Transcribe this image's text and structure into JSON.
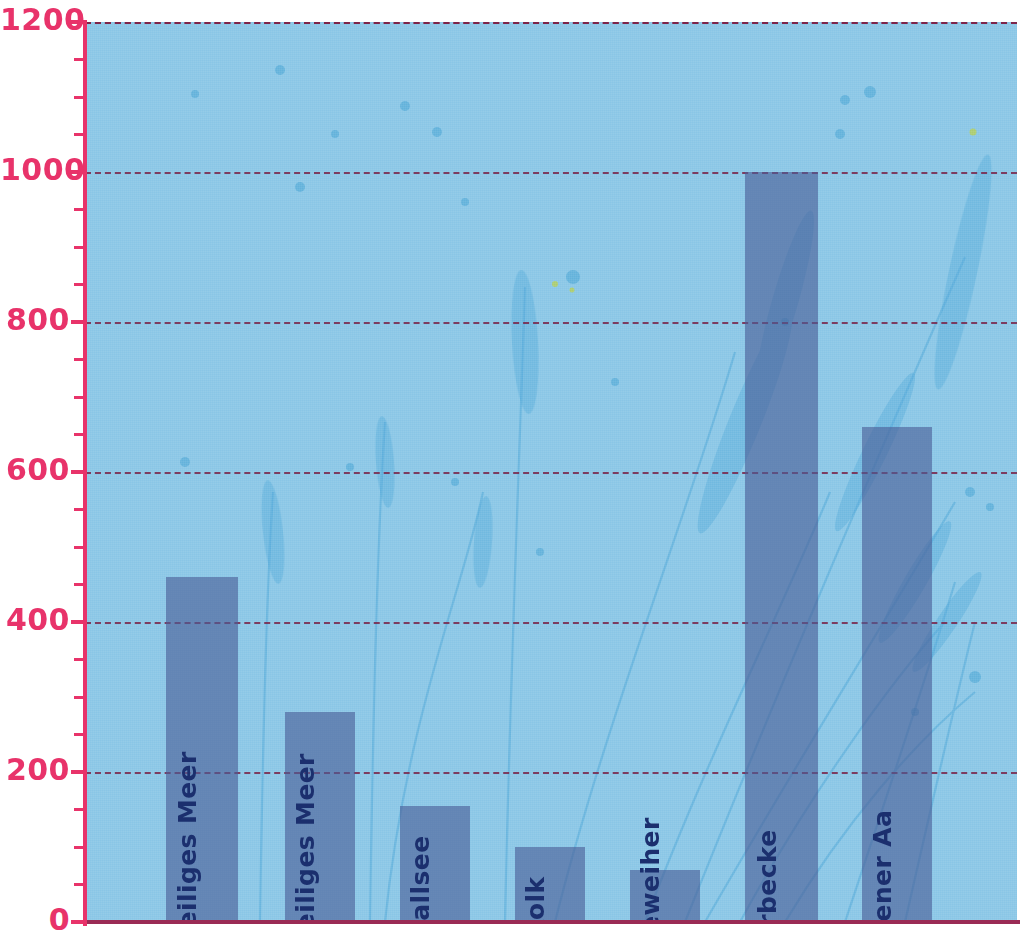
{
  "chart_data": {
    "type": "bar",
    "title": "",
    "subtitle": "",
    "xlabel": "",
    "ylabel": "",
    "categories": [
      "Kleines  Heiliges Meer",
      "Großes Heiliges Meer",
      "Erdfallsee",
      "Kolk",
      "Heideweiher",
      "Meerbecke",
      "Hopstener Aa"
    ],
    "values": [
      460,
      280,
      155,
      100,
      70,
      1000,
      660
    ],
    "ylim": [
      0,
      1200
    ],
    "yticks": [
      0,
      200,
      400,
      600,
      800,
      1000,
      1200
    ],
    "ytick_labels": [
      "0",
      "200",
      "400",
      "600",
      "800",
      "1000",
      "1200"
    ],
    "minor_tick_step": 50,
    "grid": true,
    "grid_style": "dashed-horizontal",
    "legend": "none",
    "orientation": "vertical",
    "bar_label_position": "inside-rotated-vertical"
  },
  "axis": {
    "y_label_color": "#e8336a",
    "y_axis_line_color": "#e8336a",
    "x_axis_line_color": "#9a2b55",
    "gridline_color": "#7a2448"
  },
  "colors": {
    "plot_background": "#89c6e6",
    "bar_fill": "#4a5d96",
    "bar_label_text": "#1b2f6e",
    "page_background": "#ffffff",
    "reed_accent": "#4fa8d8"
  },
  "bars": [
    {
      "label": "Kleines  Heiliges Meer",
      "value": 460,
      "left_px": 166,
      "width_px": 72
    },
    {
      "label": "Großes Heiliges Meer",
      "value": 280,
      "left_px": 285,
      "width_px": 70
    },
    {
      "label": "Erdfallsee",
      "value": 155,
      "left_px": 400,
      "width_px": 70
    },
    {
      "label": "Kolk",
      "value": 100,
      "left_px": 515,
      "width_px": 70
    },
    {
      "label": "Heideweiher",
      "value": 70,
      "left_px": 630,
      "width_px": 70
    },
    {
      "label": "Meerbecke",
      "value": 1000,
      "left_px": 745,
      "width_px": 73
    },
    {
      "label": "Hopstener Aa",
      "value": 660,
      "left_px": 862,
      "width_px": 70
    }
  ]
}
